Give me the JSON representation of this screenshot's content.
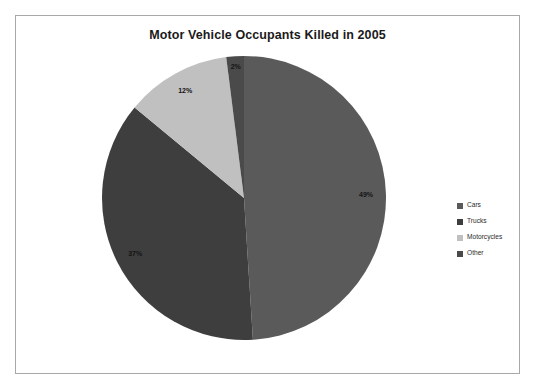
{
  "chart_data": {
    "type": "pie",
    "title": "Motor Vehicle Occupants Killed in 2005",
    "categories": [
      "Cars",
      "Trucks",
      "Motorcycles",
      "Other"
    ],
    "values": [
      49,
      37,
      12,
      2
    ],
    "labels": [
      "49%",
      "37%",
      "12%",
      "2%"
    ],
    "unit": "%",
    "legend_position": "right",
    "grid": false,
    "xlabel": "",
    "ylabel": "",
    "start_angle_deg": 0,
    "direction": "clockwise",
    "colors": [
      "#5a5a5a",
      "#3e3e3e",
      "#c0c0c0",
      "#4a4a4a"
    ],
    "slices": [
      {
        "name": "Cars",
        "value": 49,
        "label": "49%",
        "color": "#5a5a5a"
      },
      {
        "name": "Trucks",
        "value": 37,
        "label": "37%",
        "color": "#3e3e3e"
      },
      {
        "name": "Motorcycles",
        "value": 12,
        "label": "12%",
        "color": "#c0c0c0"
      },
      {
        "name": "Other",
        "value": 2,
        "label": "2%",
        "color": "#4a4a4a"
      }
    ]
  },
  "legend": {
    "items": [
      {
        "label": "Cars",
        "color": "#5a5a5a"
      },
      {
        "label": "Trucks",
        "color": "#3e3e3e"
      },
      {
        "label": "Motorcycles",
        "color": "#c0c0c0"
      },
      {
        "label": "Other",
        "color": "#4a4a4a"
      }
    ]
  },
  "frame": {
    "border_color": "#a8a8a8",
    "background": "#ffffff"
  }
}
